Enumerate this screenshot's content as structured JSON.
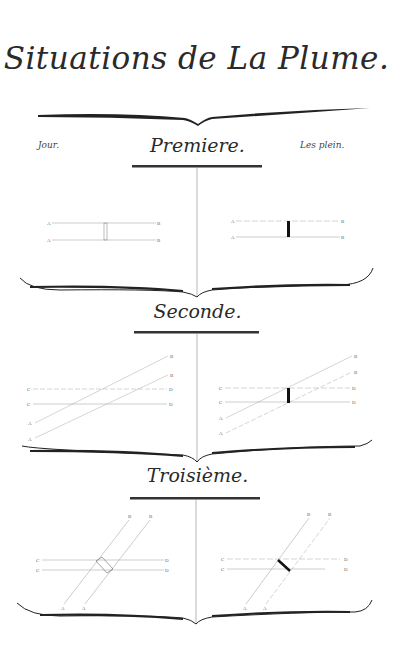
{
  "plate": {
    "title": "Situations de La Plume.",
    "left_note": "Jour.",
    "right_note": "Les plein.",
    "sections": [
      {
        "heading": "Premiere.",
        "left_figure": {
          "labels": [
            "A",
            "B",
            "A",
            "B",
            "1",
            "2",
            "3",
            "4"
          ]
        },
        "right_figure": {
          "labels": [
            "A",
            "B",
            "A",
            "B",
            "1",
            "2",
            "3",
            "4"
          ]
        }
      },
      {
        "heading": "Seconde.",
        "left_figure": {
          "labels": [
            "C",
            "D",
            "C",
            "D",
            "A",
            "B",
            "A",
            "B",
            "1",
            "2"
          ]
        },
        "right_figure": {
          "labels": [
            "C",
            "D",
            "C",
            "D",
            "A",
            "B",
            "A",
            "B",
            "1",
            "2"
          ]
        }
      },
      {
        "heading": "Troisième.",
        "left_figure": {
          "labels": [
            "C",
            "D",
            "C",
            "D",
            "A",
            "B",
            "A",
            "B",
            "1",
            "2"
          ]
        },
        "right_figure": {
          "labels": [
            "C",
            "D",
            "C",
            "D",
            "A",
            "B",
            "A",
            "B",
            "1",
            "2"
          ]
        }
      }
    ]
  }
}
